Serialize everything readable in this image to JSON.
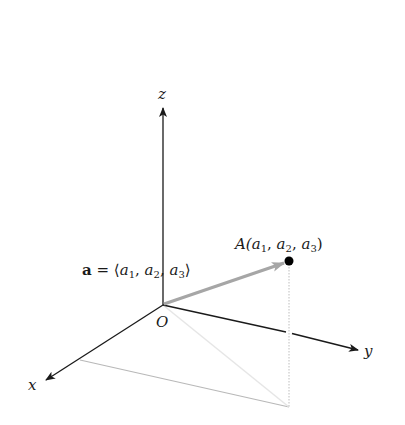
{
  "figure": {
    "axes": {
      "z_label": "z",
      "y_label": "y",
      "x_label": "x",
      "origin_label": "O"
    },
    "point": {
      "label_prefix": "A(",
      "a1": "a",
      "sub1": "1",
      "sep1": ", ",
      "a2": "a",
      "sub2": "2",
      "sep2": ", ",
      "a3": "a",
      "sub3": "3",
      "label_suffix": ")"
    },
    "vector": {
      "name": "a",
      "equals": " = ⟨",
      "a1": "a",
      "sub1": "1",
      "sep1": ", ",
      "a2": "a",
      "sub2": "2",
      "sep2": ", ",
      "a3": "a",
      "sub3": "3",
      "close": "⟩"
    },
    "colors": {
      "axis": "#1a1a1a",
      "vector": "#a6a6a6",
      "projection": "#bdbdbd",
      "point": "#000000"
    }
  }
}
